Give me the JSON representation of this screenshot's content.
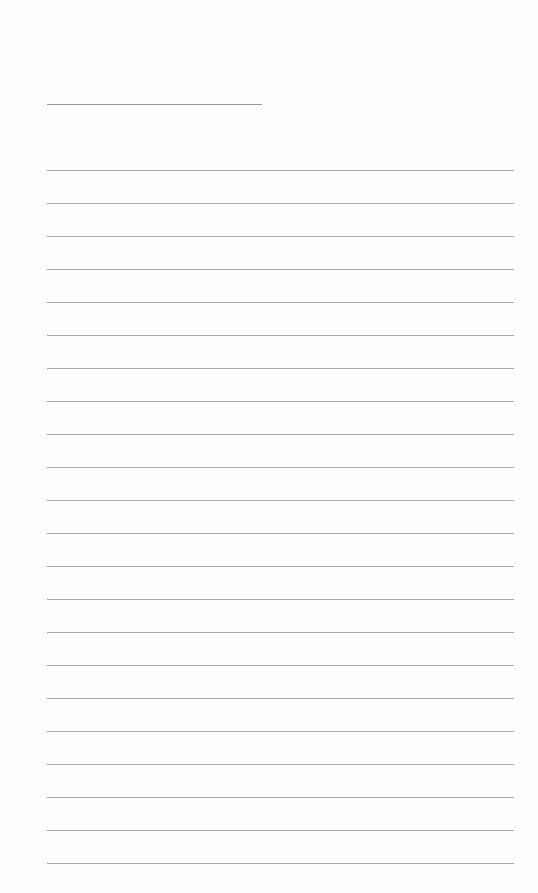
{
  "page": {
    "type": "blank lined sheet",
    "title_line": {
      "label": ""
    },
    "ruled_lines": {
      "count": 22,
      "first_y": 170,
      "spacing": 33,
      "color": "#a8a8a8"
    },
    "background_color": "#fefefe"
  }
}
